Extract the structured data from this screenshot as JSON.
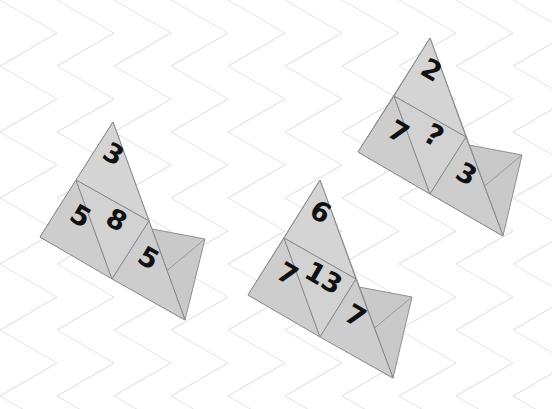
{
  "canvas": {
    "width": 552,
    "height": 409
  },
  "background": {
    "name": "diamond-grid",
    "color": "#ffffff",
    "line_color": "#e2e2e6",
    "line_width": 1,
    "spacing": 57,
    "angles_deg": [
      30,
      -30
    ]
  },
  "style": {
    "face_fill": "#cfcfcf",
    "face_fill_light": "#d6d6d6",
    "flap_fill": "#c2c2c2",
    "edge_color": "#8c8c8c",
    "edge_width": 1,
    "number_color": "#111111",
    "number_font_size": 27
  },
  "puzzle": {
    "title": "triangle-net-number-puzzle",
    "answer_placeholder": "?",
    "shapes": [
      {
        "id": "shape-left",
        "name": "triangle-net-left",
        "apex": [
          113,
          122
        ],
        "left": [
          40,
          237
        ],
        "right": [
          185,
          320
        ],
        "rotation_deg": 30,
        "cells": [
          {
            "name": "cell-top",
            "value": "3",
            "x": 109,
            "y": 162
          },
          {
            "name": "cell-left",
            "value": "5",
            "x": 76,
            "y": 224
          },
          {
            "name": "cell-center",
            "value": "8",
            "x": 112,
            "y": 228
          },
          {
            "name": "cell-right",
            "value": "5",
            "x": 144,
            "y": 266
          }
        ],
        "flap": {
          "name": "fold-flap",
          "points": "152,229 205,239 185,320 152,283"
        }
      },
      {
        "id": "shape-middle",
        "name": "triangle-net-middle",
        "apex": [
          320,
          180
        ],
        "left": [
          248,
          295
        ],
        "right": [
          393,
          378
        ],
        "rotation_deg": 30,
        "cells": [
          {
            "name": "cell-top",
            "value": "6",
            "x": 316,
            "y": 220
          },
          {
            "name": "cell-left",
            "value": "7",
            "x": 283,
            "y": 282
          },
          {
            "name": "cell-center",
            "value": "13",
            "x": 319,
            "y": 286
          },
          {
            "name": "cell-right",
            "value": "7",
            "x": 351,
            "y": 324
          }
        ],
        "flap": {
          "name": "fold-flap",
          "points": "359,287 412,297 393,378 359,341"
        }
      },
      {
        "id": "shape-right",
        "name": "triangle-net-right",
        "apex": [
          430,
          38
        ],
        "left": [
          358,
          152
        ],
        "right": [
          503,
          236
        ],
        "rotation_deg": 30,
        "cells": [
          {
            "name": "cell-top",
            "value": "2",
            "x": 427,
            "y": 78
          },
          {
            "name": "cell-left",
            "value": "7",
            "x": 394,
            "y": 140
          },
          {
            "name": "cell-center",
            "value": "?",
            "x": 429,
            "y": 144
          },
          {
            "name": "cell-right",
            "value": "3",
            "x": 462,
            "y": 182
          }
        ],
        "flap": {
          "name": "fold-flap",
          "points": "469,145 522,155 503,236 469,199"
        }
      }
    ]
  }
}
